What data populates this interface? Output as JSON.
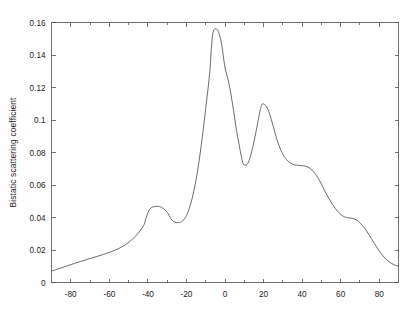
{
  "figure": {
    "background_color": "#ffffff",
    "curve_color": "#595959",
    "axis_color": "#4d4d4d"
  },
  "chart_data": {
    "type": "line",
    "title": "",
    "subtitle": "",
    "xlabel": "",
    "ylabel": "Bistatic scattering coefficient",
    "xlim": [
      -90,
      90
    ],
    "ylim": [
      0,
      0.16
    ],
    "grid": false,
    "legend": null,
    "legend_position": "none",
    "x_ticks": [
      -80,
      -60,
      -40,
      -20,
      0,
      20,
      40,
      60,
      80
    ],
    "x_tick_labels": [
      "-80",
      "-60",
      "-40",
      "-20",
      "0",
      "20",
      "40",
      "60",
      "80"
    ],
    "x_minor_ticks": [
      -90,
      -70,
      -50,
      -30,
      -10,
      10,
      30,
      50,
      70,
      90
    ],
    "y_ticks": [
      0,
      0.02,
      0.04,
      0.06,
      0.08,
      0.1,
      0.12,
      0.14,
      0.16
    ],
    "y_tick_labels": [
      "0",
      "0.02",
      "0.04",
      "0.06",
      "0.08",
      "0.1",
      "0.12",
      "0.14",
      "0.16"
    ],
    "series": [
      {
        "name": "Bistatic scattering coefficient",
        "color": "#595959",
        "x": [
          -90,
          -87,
          -84,
          -81,
          -78,
          -75,
          -72,
          -69,
          -66,
          -63,
          -60,
          -57,
          -54,
          -51,
          -48,
          -45,
          -42,
          -41,
          -39,
          -36,
          -33,
          -30,
          -28,
          -26,
          -24,
          -22,
          -20,
          -18,
          -16,
          -14,
          -12,
          -10,
          -8,
          -7,
          -6,
          -4,
          -2,
          0,
          2,
          4,
          6,
          8,
          9,
          10,
          12,
          14,
          16,
          18,
          19,
          20,
          22,
          24,
          26,
          28,
          30,
          32,
          34,
          36,
          38,
          40,
          42,
          44,
          46,
          48,
          50,
          52,
          55,
          58,
          60,
          62,
          64,
          66,
          68,
          70,
          73,
          76,
          79,
          82,
          85,
          88,
          90
        ],
        "y": [
          0.007,
          0.0082,
          0.0094,
          0.0106,
          0.0118,
          0.0129,
          0.014,
          0.0151,
          0.0162,
          0.0173,
          0.0185,
          0.0199,
          0.0216,
          0.0238,
          0.0266,
          0.0304,
          0.0355,
          0.0395,
          0.0452,
          0.0468,
          0.0463,
          0.0432,
          0.0391,
          0.0371,
          0.0369,
          0.0379,
          0.0412,
          0.0476,
          0.0572,
          0.0704,
          0.0873,
          0.1072,
          0.1283,
          0.1455,
          0.1548,
          0.1556,
          0.1482,
          0.1323,
          0.1228,
          0.1092,
          0.0935,
          0.0806,
          0.0748,
          0.0723,
          0.0736,
          0.0812,
          0.0923,
          0.1046,
          0.1092,
          0.1099,
          0.1073,
          0.1004,
          0.0918,
          0.0843,
          0.0789,
          0.0755,
          0.0734,
          0.0724,
          0.0721,
          0.0719,
          0.0715,
          0.0703,
          0.0681,
          0.0648,
          0.0606,
          0.0558,
          0.0495,
          0.0444,
          0.0419,
          0.0404,
          0.0398,
          0.0395,
          0.0386,
          0.0368,
          0.0325,
          0.0269,
          0.0212,
          0.0163,
          0.0128,
          0.0108,
          0.0101
        ]
      }
    ],
    "annotations": [],
    "features": {
      "left_shoulder_peak": {
        "x": -41,
        "y": 0.047
      },
      "left_valley": {
        "x": -25,
        "y": 0.0369
      },
      "main_peak": {
        "x": -7,
        "y": 0.156
      },
      "mid_valley": {
        "x": 9,
        "y": 0.072
      },
      "secondary_peak": {
        "x": 19,
        "y": 0.11
      },
      "right_plateau": {
        "x": 38,
        "y": 0.072
      },
      "right_shoulder": {
        "x": 64,
        "y": 0.04
      },
      "left_endpoint": {
        "x": -90,
        "y": 0.007
      },
      "right_endpoint": {
        "x": 90,
        "y": 0.01
      }
    }
  }
}
